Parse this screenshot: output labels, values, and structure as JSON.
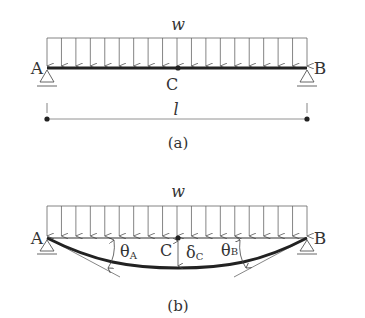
{
  "figure_a": {
    "caption": "(a)",
    "load_label": "w",
    "left_support_label": "A",
    "right_support_label": "B",
    "midpoint_label": "C",
    "span_label": "l",
    "arrow_count": 19
  },
  "figure_b": {
    "caption": "(b)",
    "load_label": "w",
    "left_support_label": "A",
    "right_support_label": "B",
    "midpoint_label": "C",
    "slope_left_label": "θ",
    "slope_left_sub": "A",
    "slope_right_label": "θ",
    "slope_right_sub": "B",
    "deflection_label": "δ",
    "deflection_sub": "C",
    "arrow_count": 19
  },
  "colors": {
    "line": "#555555",
    "beam": "#222222",
    "text": "#333333"
  }
}
